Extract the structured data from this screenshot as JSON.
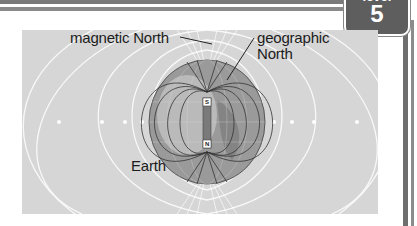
{
  "badge": {
    "top_label": "level",
    "number": "5"
  },
  "diagram": {
    "labels": {
      "magnetic_north": "magnetic North",
      "geographic_north_line1": "geographic",
      "geographic_north_line2": "North",
      "earth": "Earth"
    },
    "magnet": {
      "top_pole": "S",
      "bottom_pole": "N"
    },
    "colors": {
      "background": "#d6d6d6",
      "field_lines": "#ffffff",
      "globe": "#8f8f8f",
      "magnet": "#7a7a7a",
      "frame": "#6e6e6e"
    }
  }
}
